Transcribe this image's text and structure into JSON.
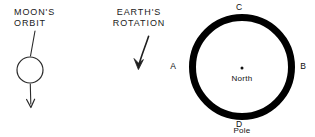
{
  "figure": {
    "width": 315,
    "height": 137,
    "background": "#ffffff",
    "ink": "#000000"
  },
  "moon_panel": {
    "label_line_1": "MOON'S",
    "label_line_2": "ORBIT",
    "label": "MOON'S\nORBIT",
    "body_shape": "open-circle",
    "body_center": {
      "x": 30,
      "y": 70
    },
    "body_radius": 13,
    "leader_line": {
      "from": {
        "x": 34,
        "y": 31
      },
      "to": {
        "x": 30,
        "y": 57
      }
    },
    "motion_arrow": {
      "name": "moon-motion-arrow",
      "direction": "down",
      "from": {
        "x": 30,
        "y": 83
      },
      "to": {
        "x": 31,
        "y": 108
      }
    }
  },
  "earth_panel": {
    "label_line_1": "EARTH'S",
    "label_line_2": "ROTATION",
    "label": "EARTH'S\nROTATION",
    "rotation_arrow": {
      "name": "earth-rotation-arrow",
      "direction": "down-left-curved",
      "from": {
        "x": 148,
        "y": 36
      },
      "to": {
        "x": 138,
        "y": 69
      }
    },
    "globe": {
      "name": "earth-ring",
      "center": {
        "x": 242,
        "y": 67
      },
      "outer_radius": 53,
      "ring_thickness": 7,
      "fill": "#ffffff",
      "stroke": "#000000"
    },
    "pole": {
      "line_1": "North",
      "line_2": "Pole",
      "text": "North\nPole",
      "dot": {
        "x": 242,
        "y": 68,
        "r": 1.4
      }
    },
    "points": [
      {
        "id": "A",
        "label": "A",
        "angle_deg": 180,
        "position": {
          "x": 173,
          "y": 67
        }
      },
      {
        "id": "B",
        "label": "B",
        "angle_deg": 0,
        "position": {
          "x": 303,
          "y": 67
        }
      },
      {
        "id": "C",
        "label": "C",
        "angle_deg": 90,
        "position": {
          "x": 239,
          "y": 8
        }
      },
      {
        "id": "D",
        "label": "D",
        "angle_deg": 270,
        "position": {
          "x": 239,
          "y": 125
        }
      }
    ]
  }
}
